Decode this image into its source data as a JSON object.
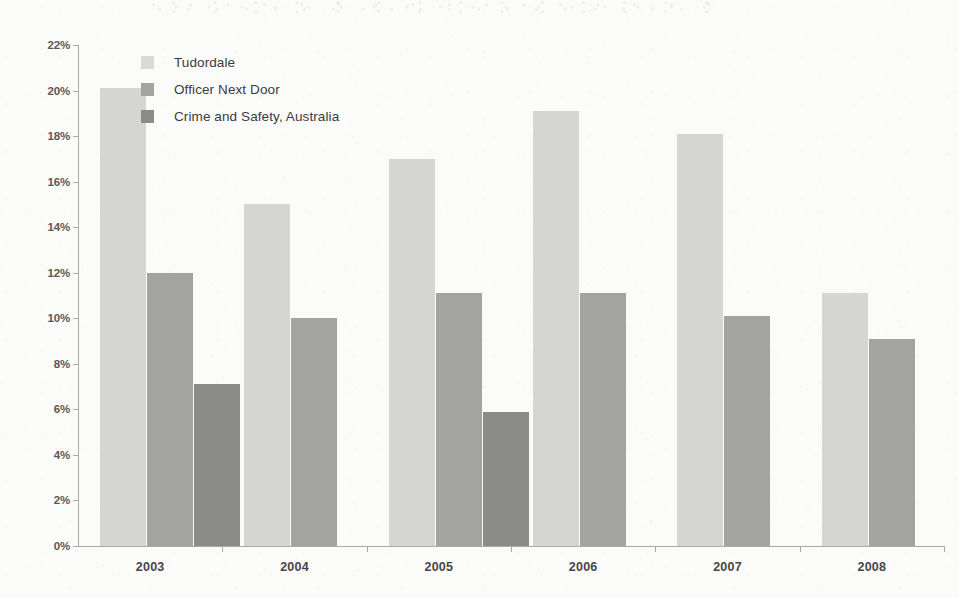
{
  "chart_data": {
    "type": "bar",
    "title": "",
    "subtitle": "",
    "xlabel": "",
    "ylabel": "",
    "categories": [
      "2003",
      "2004",
      "2005",
      "2006",
      "2007",
      "2008"
    ],
    "series": [
      {
        "name": "Tudordale",
        "color": "#d5d5d3",
        "values": [
          20.1,
          15.0,
          17.0,
          19.1,
          18.1,
          11.1
        ]
      },
      {
        "name": "Officer Next Door",
        "color": "#a3a3a1",
        "values": [
          12.0,
          10.0,
          11.1,
          11.1,
          10.1,
          9.1
        ]
      },
      {
        "name": "Crime and Safety, Australia",
        "color": "#8b8b89",
        "values": [
          7.1,
          null,
          5.9,
          null,
          null,
          null
        ]
      }
    ],
    "ylim": [
      0,
      22
    ],
    "ytick_step": 2,
    "ytick_labels": [
      "0%",
      "2%",
      "4%",
      "6%",
      "8%",
      "10%",
      "12%",
      "14%",
      "16%",
      "18%",
      "20%",
      "22%"
    ],
    "ytick_values": [
      0,
      2,
      4,
      6,
      8,
      10,
      12,
      14,
      16,
      18,
      20,
      22
    ],
    "value_suffix": "%",
    "grid": false,
    "legend_position": "inside-top-left"
  },
  "legend": {
    "items": [
      {
        "label": "Tudordale"
      },
      {
        "label": "Officer Next Door"
      },
      {
        "label": "Crime and Safety, Australia"
      }
    ]
  }
}
